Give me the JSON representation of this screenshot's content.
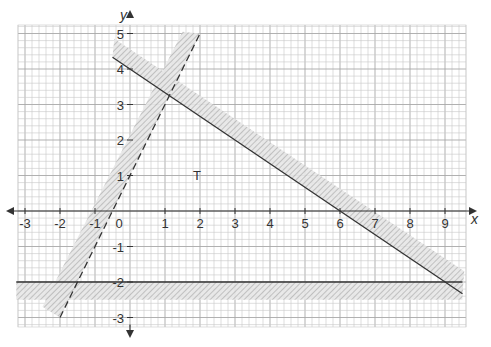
{
  "chart_data": {
    "type": "line",
    "title": "",
    "xlabel": "x",
    "ylabel": "y",
    "xlim": [
      -3.2,
      9.5
    ],
    "ylim": [
      -3.3,
      5.2
    ],
    "grid": true,
    "grid_minor_step": 0.2,
    "x_ticks": [
      "-3",
      "-2",
      "-1",
      "0",
      "1",
      "2",
      "3",
      "4",
      "5",
      "6",
      "7",
      "8",
      "9"
    ],
    "y_ticks": [
      "-3",
      "-2",
      "-1",
      "1",
      "2",
      "3",
      "4",
      "5"
    ],
    "series": [
      {
        "name": "y = 2x + 1",
        "style": "dashed",
        "x": [
          -2,
          2
        ],
        "y": [
          -3,
          5
        ],
        "shaded_side": "left/above"
      },
      {
        "name": "y = 4 - 2x/3",
        "style": "solid",
        "x": [
          -0.5,
          9.5
        ],
        "y": [
          4.33,
          -2.33
        ],
        "shaded_side": "above"
      },
      {
        "name": "y = -2",
        "style": "solid",
        "x": [
          -3.2,
          9.5
        ],
        "y": [
          -2,
          -2
        ],
        "shaded_side": "below"
      }
    ],
    "annotations": [
      {
        "text": "T",
        "x": 1.9,
        "y": 1.05
      }
    ]
  },
  "labels": {
    "x_axis": "x",
    "y_axis": "y",
    "region": "T",
    "xticks": [
      {
        "v": -3,
        "t": "-3"
      },
      {
        "v": -2,
        "t": "-2"
      },
      {
        "v": -1,
        "t": "-1"
      },
      {
        "v": 1,
        "t": "1"
      },
      {
        "v": 2,
        "t": "2"
      },
      {
        "v": 3,
        "t": "3"
      },
      {
        "v": 4,
        "t": "4"
      },
      {
        "v": 5,
        "t": "5"
      },
      {
        "v": 6,
        "t": "6"
      },
      {
        "v": 7,
        "t": "7"
      },
      {
        "v": 8,
        "t": "8"
      },
      {
        "v": 9,
        "t": "9"
      }
    ],
    "origin": "0",
    "yticks": [
      {
        "v": 5,
        "t": "5"
      },
      {
        "v": 4,
        "t": "4"
      },
      {
        "v": 3,
        "t": "3"
      },
      {
        "v": 2,
        "t": "2"
      },
      {
        "v": 1,
        "t": "1"
      },
      {
        "v": -1,
        "t": "-1"
      },
      {
        "v": -2,
        "t": "-2"
      },
      {
        "v": -3,
        "t": "-3"
      }
    ]
  },
  "colors": {
    "grid_minor": "#c8c8c8",
    "grid_major": "#a8a8a8",
    "axis": "#333333",
    "line": "#333333",
    "hatch": "#9a9a9a",
    "shade": "#e4e4e4"
  }
}
